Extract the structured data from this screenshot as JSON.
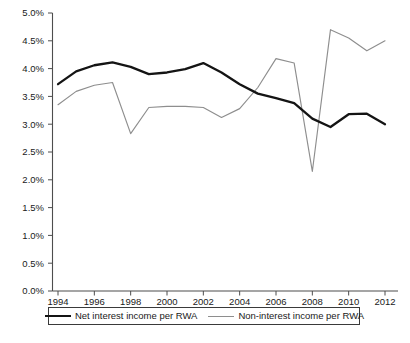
{
  "chart_data": {
    "type": "line",
    "title": "",
    "xlabel": "",
    "ylabel": "",
    "x": [
      1994,
      1995,
      1996,
      1997,
      1998,
      1999,
      2000,
      2001,
      2002,
      2003,
      2004,
      2005,
      2006,
      2007,
      2008,
      2009,
      2010,
      2011,
      2012
    ],
    "categories": [
      "1994",
      "1995",
      "1996",
      "1997",
      "1998",
      "1999",
      "2000",
      "2001",
      "2002",
      "2003",
      "2004",
      "2005",
      "2006",
      "2007",
      "2008",
      "2009",
      "2010",
      "2011",
      "2012"
    ],
    "series": [
      {
        "name": "Net interest income per RWA",
        "color": "#141414",
        "values": [
          3.72,
          3.95,
          4.06,
          4.11,
          4.03,
          3.9,
          3.93,
          3.99,
          4.1,
          3.93,
          3.72,
          3.55,
          3.47,
          3.38,
          3.1,
          2.95,
          3.18,
          3.19,
          3.0
        ]
      },
      {
        "name": "Non-interest income per RWA",
        "color": "#8e8e8e",
        "values": [
          3.35,
          3.59,
          3.7,
          3.75,
          2.83,
          3.3,
          3.32,
          3.32,
          3.3,
          3.12,
          3.28,
          3.66,
          4.18,
          4.1,
          2.15,
          4.7,
          4.55,
          4.32,
          4.5
        ]
      }
    ],
    "xlim": [
      1994,
      2012
    ],
    "ylim": [
      0.0,
      5.0
    ],
    "ytick_values": [
      0.0,
      0.5,
      1.0,
      1.5,
      2.0,
      2.5,
      3.0,
      3.5,
      4.0,
      4.5,
      5.0
    ],
    "ytick_labels": [
      "0.0%",
      "0.5%",
      "1.0%",
      "1.5%",
      "2.0%",
      "2.5%",
      "3.0%",
      "3.5%",
      "4.0%",
      "4.5%",
      "5.0%"
    ],
    "xtick_values": [
      1994,
      1996,
      1998,
      2000,
      2002,
      2004,
      2006,
      2008,
      2010,
      2012
    ],
    "xtick_labels": [
      "1994",
      "1996",
      "1998",
      "2000",
      "2002",
      "2004",
      "2006",
      "2008",
      "2010",
      "2012"
    ],
    "grid": false,
    "legend_position": "bottom",
    "legend_entries": [
      "Net interest income per RWA",
      "Non-interest income per RWA"
    ]
  },
  "legend": {
    "net_label": "Net interest income per RWA",
    "non_label": "Non-interest income per RWA"
  },
  "caption": {
    "text": ""
  }
}
